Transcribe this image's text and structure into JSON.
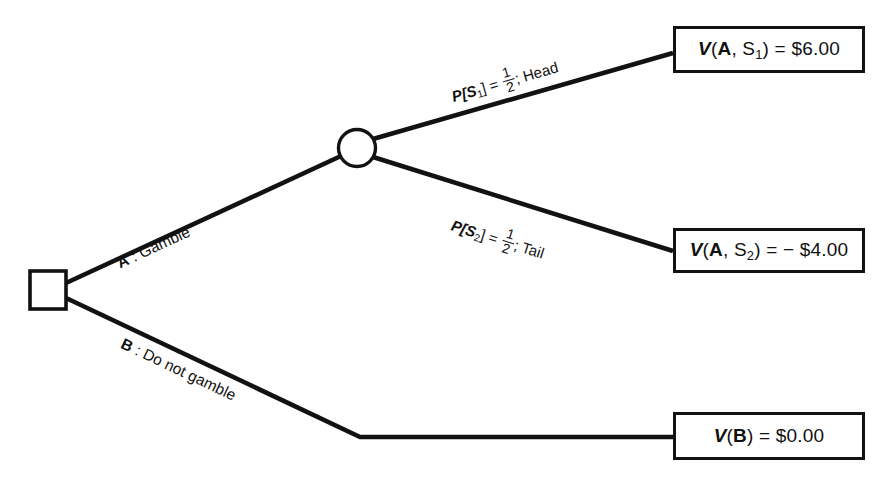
{
  "diagram": {
    "type": "decision-tree",
    "title": "",
    "stroke_color": "#121212",
    "background_color": "#ffffff",
    "nodes": {
      "decision": {
        "shape": "square",
        "label": "",
        "x": 47,
        "y": 290
      },
      "chance": {
        "shape": "circle",
        "label": "",
        "x": 357,
        "y": 148
      }
    },
    "branches": [
      {
        "id": "A",
        "letter": "A",
        "separator": " : ",
        "action": "Gamble",
        "label_full": "A : Gamble",
        "from": "decision",
        "to": "chance"
      },
      {
        "id": "B",
        "letter": "B",
        "separator": " : ",
        "action": "Do not gamble",
        "label_full": "B : Do not gamble",
        "from": "decision",
        "to": "outcome_B"
      }
    ],
    "chance_branches": [
      {
        "id": "S1",
        "prob_prefix": "P[S",
        "prob_sub": "1",
        "prob_suffix": "] = ",
        "numerator": "1",
        "denominator": "2",
        "outcome_name": "Head",
        "separator": "; ",
        "label_full": "P[S1] = 1/2; Head",
        "probability": 0.5
      },
      {
        "id": "S2",
        "prob_prefix": "P[S",
        "prob_sub": "2",
        "prob_suffix": "] = ",
        "numerator": "1",
        "denominator": "2",
        "outcome_name": "Tail",
        "separator": "; ",
        "label_full": "P[S2] = 1/2; Tail",
        "probability": 0.5
      }
    ],
    "outcomes": [
      {
        "id": "outcome_A_S1",
        "fn": "V",
        "args_open": "(",
        "arg1": "A",
        "arg_sep": ", ",
        "arg2": "S",
        "arg2_sub": "1",
        "args_close": ")",
        "equals": " = ",
        "value_text": "$6.00",
        "value": 6.0,
        "label_full": "V(A, S1) = $6.00"
      },
      {
        "id": "outcome_A_S2",
        "fn": "V",
        "args_open": "(",
        "arg1": "A",
        "arg_sep": ", ",
        "arg2": "S",
        "arg2_sub": "2",
        "args_close": ")",
        "equals": " = ",
        "value_text": "− $4.00",
        "value": -4.0,
        "label_full": "V(A, S2) = − $4.00"
      },
      {
        "id": "outcome_B",
        "fn": "V",
        "args_open": "(",
        "arg1": "B",
        "arg_sep": "",
        "arg2": "",
        "arg2_sub": "",
        "args_close": ")",
        "equals": " = ",
        "value_text": "$0.00",
        "value": 0.0,
        "label_full": "V(B) = $0.00"
      }
    ]
  }
}
